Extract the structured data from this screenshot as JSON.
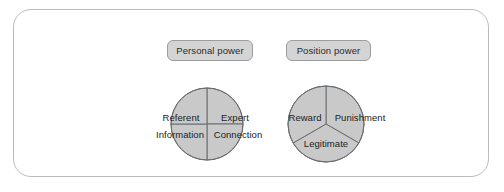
{
  "diagram": {
    "frame": {
      "border_color": "#b9bcbe",
      "background": "#ffffff"
    },
    "palette": {
      "sector_fill": "#c9c9c9",
      "sector_stroke": "#6b6e70",
      "pill_fill": "#d4d4d4",
      "pill_stroke": "#9a9d9f",
      "text": "#222222"
    },
    "groups": [
      {
        "id": "personal-power",
        "label": "Personal power",
        "chart": {
          "type": "pie",
          "slices": 4,
          "labels": [
            "Referent",
            "Expert",
            "Information",
            "Connection"
          ]
        },
        "sectors": {
          "top_left": "Referent",
          "top_right": "Expert",
          "bottom_left": "Information",
          "bottom_right": "Connection"
        }
      },
      {
        "id": "position-power",
        "label": "Position power",
        "chart": {
          "type": "pie",
          "slices": 3,
          "labels": [
            "Reward",
            "Punishment",
            "Legitimate"
          ]
        },
        "sectors": {
          "left": "Reward",
          "right": "Punishment",
          "bottom": "Legitimate"
        }
      }
    ]
  }
}
